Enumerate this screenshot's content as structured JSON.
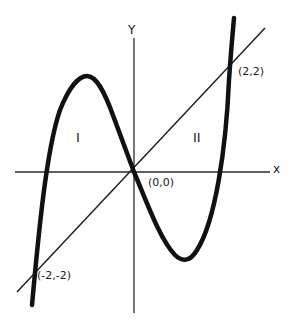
{
  "diagram": {
    "axes": {
      "x_label": "x",
      "y_label": "Y"
    },
    "regions": [
      {
        "id": "I",
        "label": "I"
      },
      {
        "id": "II",
        "label": "II"
      }
    ],
    "points": [
      {
        "label": "(-2,-2)",
        "x": -2,
        "y": -2
      },
      {
        "label": "(0,0)",
        "x": 0,
        "y": 0
      },
      {
        "label": "(2,2)",
        "x": 2,
        "y": 2
      }
    ],
    "curves": [
      {
        "name": "cubic",
        "style": "thick"
      },
      {
        "name": "line y=x",
        "style": "thin"
      }
    ],
    "colors": {
      "ink": "#1a1a1a",
      "background": "#ffffff"
    }
  }
}
